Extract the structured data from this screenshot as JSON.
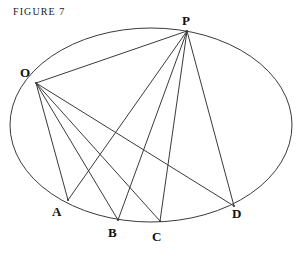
{
  "figure": {
    "caption": "FIGURE 7",
    "stroke_color": "#3a3a3a",
    "background_color": "#ffffff",
    "label_color": "#111111"
  },
  "chart_data": {
    "type": "diagram",
    "title": "FIGURE 7",
    "ellipse": {
      "center_x": 151,
      "center_y": 125,
      "radius_x": 141,
      "radius_y": 97
    },
    "points": [
      {
        "id": "O",
        "label": "O",
        "x": 36,
        "y": 83,
        "label_x": 20,
        "label_y": 66
      },
      {
        "id": "P",
        "label": "P",
        "x": 187,
        "y": 31,
        "label_x": 182,
        "label_y": 14
      },
      {
        "id": "A",
        "label": "A",
        "x": 68,
        "y": 200,
        "label_x": 52,
        "label_y": 205
      },
      {
        "id": "B",
        "label": "B",
        "x": 118,
        "y": 220,
        "label_x": 108,
        "label_y": 226
      },
      {
        "id": "C",
        "label": "C",
        "x": 160,
        "y": 221,
        "label_x": 152,
        "label_y": 230
      },
      {
        "id": "D",
        "label": "D",
        "x": 234,
        "y": 206,
        "label_x": 232,
        "label_y": 207
      }
    ],
    "segments": [
      {
        "from": "O",
        "to": "P"
      },
      {
        "from": "O",
        "to": "A"
      },
      {
        "from": "O",
        "to": "B"
      },
      {
        "from": "O",
        "to": "C"
      },
      {
        "from": "O",
        "to": "D"
      },
      {
        "from": "P",
        "to": "A"
      },
      {
        "from": "P",
        "to": "B"
      },
      {
        "from": "P",
        "to": "C"
      },
      {
        "from": "P",
        "to": "D"
      }
    ],
    "labels": [
      "O",
      "P",
      "A",
      "B",
      "C",
      "D"
    ]
  }
}
